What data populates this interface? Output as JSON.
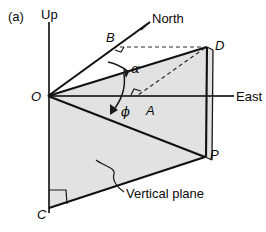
{
  "figure": {
    "panel_label": "(a)",
    "caption_note": "Vertical plane",
    "axes": {
      "up_label": "Up",
      "east_label": "East",
      "north_label": "North"
    },
    "vertices": [
      {
        "id": "O",
        "label": "O",
        "x": 48,
        "y": 96
      },
      {
        "id": "B",
        "label": "B",
        "x": 112,
        "y": 40
      },
      {
        "id": "D",
        "label": "D",
        "x": 207,
        "y": 47
      },
      {
        "id": "A",
        "label": "A",
        "x": 140,
        "y": 96
      },
      {
        "id": "P",
        "label": "P",
        "x": 205,
        "y": 157
      },
      {
        "id": "C",
        "label": "C",
        "x": 49,
        "y": 208
      }
    ],
    "angles": [
      {
        "id": "alpha",
        "label": "α",
        "between": "OB-to-OD"
      },
      {
        "id": "phi",
        "label": "ϕ",
        "between": "OD-to-OP"
      }
    ],
    "right_angles": [
      {
        "at": "B",
        "note": "dashed horizontal meets OB"
      },
      {
        "at": "A",
        "note": "dashed DA meets East axis"
      },
      {
        "at": "C",
        "note": "base corner of vertical plane"
      }
    ],
    "colors": {
      "plane_fill": "#e2e2e2",
      "stroke": "#1a1a1a",
      "axis": "#3a3a3a",
      "background": "#ffffff"
    }
  },
  "labels": {
    "panel": "(a)",
    "up": "Up",
    "north": "North",
    "east": "East",
    "vertical_plane": "Vertical plane",
    "O": "O",
    "B": "B",
    "D": "D",
    "A": "A",
    "P": "P",
    "C": "C",
    "alpha": "α",
    "phi": "ϕ"
  }
}
